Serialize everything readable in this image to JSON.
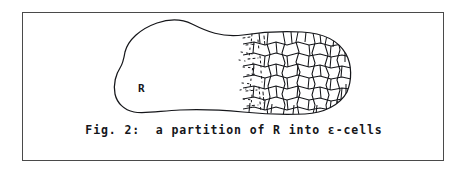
{
  "figure": {
    "caption": "Fig. 2:  a partition of R into ε-cells",
    "region_label": "R",
    "border_color": "#4a4a4a",
    "ink_color": "#15161a",
    "background_color": "#ffffff",
    "frame": {
      "x": 22,
      "y": 12,
      "width": 422,
      "height": 149
    },
    "elements": {
      "region_outline_name": "region-R-outline",
      "cell_mesh_name": "epsilon-cell-mesh",
      "transition_name": "mesh-fade-transition"
    }
  }
}
